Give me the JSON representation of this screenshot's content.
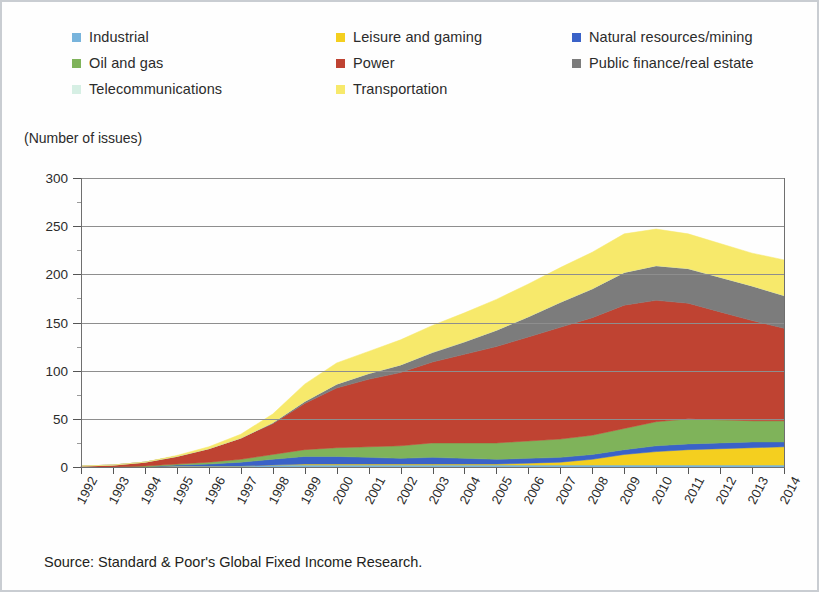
{
  "axis_title": "(Number of issues)",
  "source": "Source: Standard & Poor's Global Fixed Income Research.",
  "legend": {
    "columns": [
      [
        {
          "label": "Industrial",
          "color": "#78b4dc"
        },
        {
          "label": "Oil and gas",
          "color": "#7fb35a"
        },
        {
          "label": "Telecommunications",
          "color": "#d6efe4"
        }
      ],
      [
        {
          "label": "Leisure and gaming",
          "color": "#f4cf1f"
        },
        {
          "label": "Power",
          "color": "#bf4332"
        },
        {
          "label": "Transportation",
          "color": "#f7e96b"
        }
      ],
      [
        {
          "label": "Natural resources/mining",
          "color": "#3a62c8"
        },
        {
          "label": "Public finance/real estate",
          "color": "#7c7c7c"
        }
      ]
    ]
  },
  "chart_data": {
    "type": "area",
    "title": "",
    "subtitle": "",
    "xlabel": "",
    "ylabel": "(Number of issues)",
    "ylim": [
      0,
      300
    ],
    "yticks": [
      0,
      50,
      100,
      150,
      200,
      250,
      300
    ],
    "grid": true,
    "legend_position": "top",
    "stacked": true,
    "categories": [
      "1992",
      "1993",
      "1994",
      "1995",
      "1996",
      "1997",
      "1998",
      "1999",
      "2000",
      "2001",
      "2002",
      "2003",
      "2004",
      "2005",
      "2006",
      "2007",
      "2008",
      "2009",
      "2010",
      "2011",
      "2012",
      "2013",
      "2014"
    ],
    "series": [
      {
        "name": "Industrial",
        "color": "#78b4dc",
        "values": [
          0,
          0,
          0,
          1,
          1,
          1,
          2,
          2,
          2,
          2,
          2,
          2,
          2,
          2,
          2,
          2,
          2,
          2,
          2,
          2,
          2,
          2,
          2
        ]
      },
      {
        "name": "Leisure and gaming",
        "color": "#f4cf1f",
        "values": [
          0,
          0,
          0,
          0,
          0,
          0,
          0,
          1,
          1,
          1,
          1,
          1,
          1,
          1,
          2,
          3,
          6,
          11,
          14,
          16,
          17,
          18,
          19
        ]
      },
      {
        "name": "Natural resources/mining",
        "color": "#3a62c8",
        "values": [
          0,
          0,
          0,
          1,
          2,
          4,
          6,
          8,
          8,
          7,
          6,
          7,
          6,
          5,
          5,
          5,
          5,
          5,
          6,
          6,
          6,
          6,
          5
        ]
      },
      {
        "name": "Oil and gas",
        "color": "#7fb35a",
        "values": [
          0,
          0,
          1,
          1,
          2,
          3,
          5,
          7,
          9,
          11,
          13,
          15,
          16,
          17,
          18,
          19,
          20,
          22,
          25,
          26,
          24,
          22,
          22
        ]
      },
      {
        "name": "Power",
        "color": "#bf4332",
        "values": [
          1,
          2,
          4,
          8,
          14,
          22,
          32,
          48,
          62,
          70,
          76,
          84,
          92,
          100,
          108,
          116,
          122,
          128,
          126,
          120,
          112,
          104,
          96
        ]
      },
      {
        "name": "Public finance/real estate",
        "color": "#7c7c7c",
        "values": [
          0,
          0,
          0,
          0,
          0,
          0,
          1,
          2,
          4,
          6,
          8,
          10,
          13,
          17,
          21,
          26,
          30,
          34,
          36,
          36,
          36,
          36,
          34
        ]
      },
      {
        "name": "Telecommunications",
        "color": "#d6efe4",
        "values": [
          0,
          0,
          0,
          0,
          0,
          0,
          0,
          0,
          0,
          0,
          0,
          0,
          0,
          0,
          0,
          0,
          0,
          0,
          0,
          0,
          0,
          0,
          0
        ]
      },
      {
        "name": "Transportation",
        "color": "#f7e96b",
        "values": [
          0,
          0,
          0,
          1,
          2,
          4,
          9,
          18,
          22,
          23,
          26,
          28,
          30,
          32,
          34,
          36,
          38,
          40,
          38,
          36,
          35,
          34,
          37
        ]
      }
    ],
    "totals": [
      1,
      2,
      5,
      12,
      21,
      34,
      55,
      86,
      108,
      120,
      132,
      147,
      160,
      174,
      190,
      207,
      223,
      242,
      247,
      242,
      232,
      222,
      215
    ]
  }
}
